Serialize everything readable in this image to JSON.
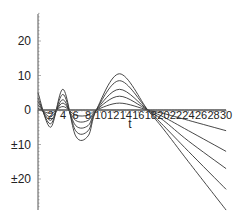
{
  "chart_data": {
    "type": "line",
    "title": "",
    "xlabel": "t",
    "ylabel": "",
    "xlim": [
      0,
      30
    ],
    "ylim": [
      -28,
      28
    ],
    "grid": false,
    "legend": null,
    "x_ticks": [
      "2",
      "4",
      "6",
      "8",
      "10",
      "12",
      "14",
      "16",
      "18",
      "20",
      "22",
      "24",
      "26",
      "28",
      "30"
    ],
    "y_ticks": [
      {
        "value": 20,
        "label": "20"
      },
      {
        "value": 10,
        "label": "10"
      },
      {
        "value": 0,
        "label": "0"
      },
      {
        "value": -10,
        "label": "±10"
      },
      {
        "value": -20,
        "label": "±20"
      }
    ],
    "x": [
      0,
      2,
      4,
      6,
      8,
      9.3,
      13,
      17.5,
      20,
      24,
      30
    ],
    "series": [
      {
        "name": "curve-1",
        "values": [
          0.5,
          -1,
          1,
          -1.5,
          -1.5,
          0,
          2,
          0,
          -1,
          -3,
          -6
        ]
      },
      {
        "name": "curve-2",
        "values": [
          1.5,
          -2,
          2,
          -3,
          -3,
          0,
          4,
          0,
          -2,
          -6,
          -12
        ]
      },
      {
        "name": "curve-3",
        "values": [
          2.5,
          -3,
          3,
          -4.5,
          -4.5,
          0,
          6,
          0,
          -3,
          -9,
          -17
        ]
      },
      {
        "name": "curve-4",
        "values": [
          3.5,
          -4,
          4.5,
          -6,
          -6,
          0,
          8.5,
          0,
          -4.5,
          -12,
          -23
        ]
      },
      {
        "name": "curve-5",
        "values": [
          5,
          -5,
          6,
          -7.5,
          -7.5,
          0,
          10.5,
          0,
          -5.5,
          -15,
          -29
        ]
      },
      {
        "name": "curve-0",
        "values": [
          0,
          0,
          0,
          0,
          0,
          0,
          0,
          0,
          0,
          0,
          0
        ]
      }
    ]
  }
}
